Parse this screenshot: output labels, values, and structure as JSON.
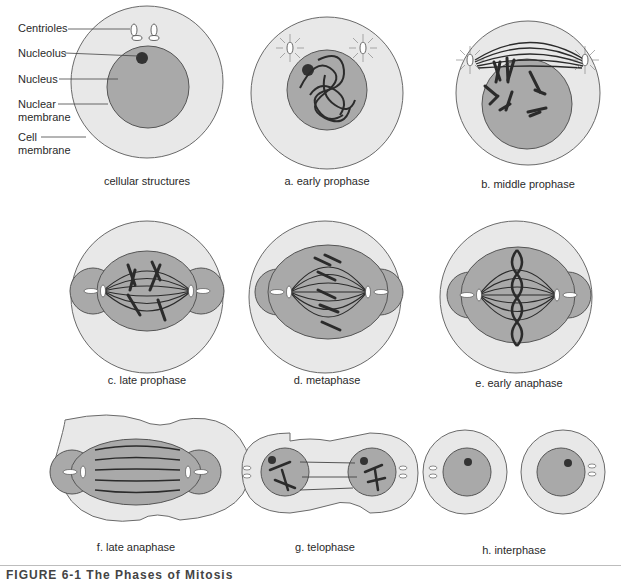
{
  "labels": {
    "centrioles": "Centrioles",
    "nucleolus": "Nucleolus",
    "nucleus": "Nucleus",
    "nuclear_membrane_1": "Nuclear",
    "nuclear_membrane_2": "membrane",
    "cell_membrane_1": "Cell",
    "cell_membrane_2": "membrane"
  },
  "captions": {
    "cellular": "cellular structures",
    "a": "a. early prophase",
    "b": "b. middle prophase",
    "c": "c. late prophase",
    "d": "d. metaphase",
    "e": "e. early anaphase",
    "f": "f. late anaphase",
    "g": "g. telophase",
    "h": "h. interphase"
  },
  "figure_caption": "FIGURE 6-1   The Phases of Mitosis",
  "colors": {
    "cytoplasm": "#e8e8e8",
    "nucleus": "#a9a9a9",
    "chromosome": "#2b2b2b",
    "outline": "#6a6a6a"
  }
}
